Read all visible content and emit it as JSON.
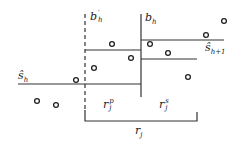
{
  "diagram": {
    "labels": {
      "b_h_prime": {
        "base": "b",
        "sup": "′",
        "sub": "h"
      },
      "b_h": {
        "base": "b",
        "sub": "h"
      },
      "s_hat_h": {
        "base": "ŝ",
        "sub": "h"
      },
      "s_hat_h1": {
        "base": "ŝ",
        "sub": "h+1"
      },
      "r_j_p": {
        "base": "r",
        "sup": "p",
        "sub": "j"
      },
      "r_j_s": {
        "base": "r",
        "sup": "s",
        "sub": "j"
      },
      "r_j": {
        "base": "r",
        "sub": "j"
      }
    },
    "colors": {
      "line": "#333333",
      "point": "#222222",
      "background": "#ffffff"
    },
    "points": [
      {
        "x": 112,
        "y": 44
      },
      {
        "x": 131,
        "y": 58
      },
      {
        "x": 94,
        "y": 68
      },
      {
        "x": 150,
        "y": 44
      },
      {
        "x": 168,
        "y": 53
      },
      {
        "x": 206,
        "y": 35
      },
      {
        "x": 224,
        "y": 21
      },
      {
        "x": 76,
        "y": 80
      },
      {
        "x": 37,
        "y": 101
      },
      {
        "x": 56,
        "y": 105
      },
      {
        "x": 188,
        "y": 77
      }
    ]
  }
}
